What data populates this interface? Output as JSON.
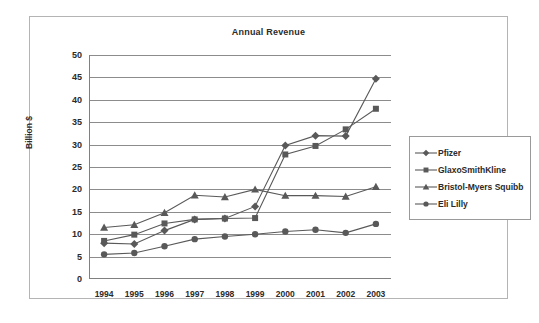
{
  "chart_data": {
    "type": "line",
    "title": "Annual Revenue",
    "xlabel": "",
    "ylabel": "Billion $",
    "ylim": [
      0,
      50
    ],
    "ytick_step": 5,
    "yticks": [
      0,
      5,
      10,
      15,
      20,
      25,
      30,
      35,
      40,
      45,
      50
    ],
    "grid": true,
    "legend_position": "right",
    "categories": [
      "1994",
      "1995",
      "1996",
      "1997",
      "1998",
      "1999",
      "2000",
      "2001",
      "2002",
      "2003"
    ],
    "series": [
      {
        "name": "Pfizer",
        "marker": "diamond",
        "color": "#595959",
        "values": [
          8.0,
          7.8,
          10.8,
          13.3,
          13.5,
          16.2,
          29.8,
          32.0,
          31.9,
          44.7
        ]
      },
      {
        "name": "GlaxoSmithKline",
        "marker": "square",
        "color": "#595959",
        "values": [
          8.5,
          9.9,
          12.4,
          13.3,
          13.5,
          13.6,
          27.8,
          29.7,
          33.4,
          38.0
        ]
      },
      {
        "name": "Bristol-Myers Squibb",
        "marker": "triangle",
        "color": "#595959",
        "values": [
          11.5,
          12.1,
          14.8,
          18.7,
          18.3,
          20.0,
          18.6,
          18.6,
          18.4,
          20.6
        ]
      },
      {
        "name": "Eli Lilly",
        "marker": "circle",
        "color": "#595959",
        "values": [
          5.5,
          5.8,
          7.3,
          8.9,
          9.5,
          10.0,
          10.6,
          11.0,
          10.3,
          12.3
        ]
      }
    ]
  },
  "colors": {
    "frame_border": "#b4b4b4",
    "gridline": "#8c8c8c",
    "axis": "#808080",
    "text": "#2b2b2b",
    "series": "#595959"
  }
}
